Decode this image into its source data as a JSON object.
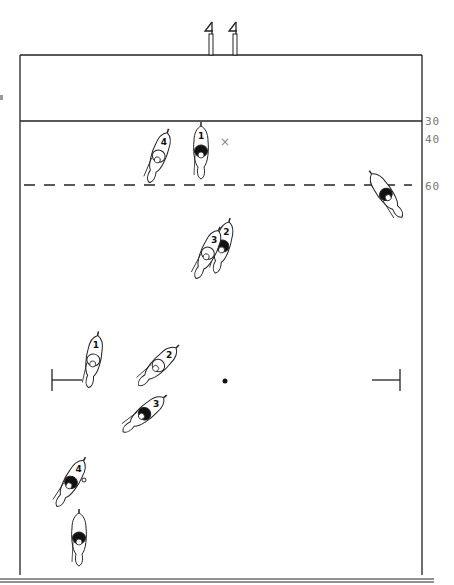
{
  "diagram": {
    "type": "polo field play diagram",
    "colors": {
      "line": "#222222",
      "dashed": "#222222",
      "label": "#777777",
      "team_dark": "#111111",
      "team_light": "#ffffff"
    },
    "goal_posts": [
      {
        "x": 211
      },
      {
        "x": 235
      }
    ],
    "lines": {
      "end_line_y": 55,
      "yard30_y": 121,
      "yard60_dashed_y": 185,
      "field_left_x": 20,
      "field_right_x": 422,
      "bottom_y": 583
    },
    "yard_labels": [
      {
        "text": "30",
        "y": 115
      },
      {
        "text": "40",
        "y": 133
      },
      {
        "text": "60",
        "y": 180
      }
    ],
    "penalty_marks": [
      {
        "side": "left",
        "x": 52,
        "y": 380
      },
      {
        "side": "right",
        "x": 401,
        "y": 380
      }
    ],
    "ball": {
      "x": 225,
      "y": 381
    },
    "x_mark": {
      "text": "×",
      "x": 224,
      "y": 142
    },
    "players": [
      {
        "team": "light",
        "number": "4",
        "x": 158,
        "y": 158,
        "angle": 200
      },
      {
        "team": "dark",
        "number": "1",
        "x": 201,
        "y": 153,
        "angle": 180
      },
      {
        "team": "dark",
        "number": "",
        "x": 387,
        "y": 196,
        "angle": 145
      },
      {
        "team": "dark",
        "number": "2",
        "x": 222,
        "y": 248,
        "angle": 195
      },
      {
        "team": "light",
        "number": "3",
        "x": 207,
        "y": 255,
        "angle": 205
      },
      {
        "team": "light",
        "number": "1",
        "x": 93,
        "y": 362,
        "angle": 190
      },
      {
        "team": "light",
        "number": "2",
        "x": 157,
        "y": 367,
        "angle": 225
      },
      {
        "team": "dark",
        "number": "3",
        "x": 143,
        "y": 415,
        "angle": 230
      },
      {
        "team": "dark",
        "number": "4",
        "x": 70,
        "y": 484,
        "angle": 210
      },
      {
        "team": "dark",
        "number": "",
        "x": 79,
        "y": 540,
        "angle": 180
      }
    ]
  }
}
